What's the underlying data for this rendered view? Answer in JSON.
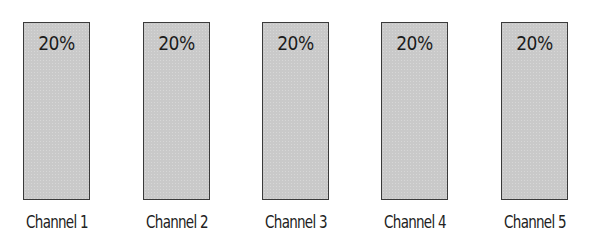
{
  "diagram": {
    "channels": [
      {
        "label": "Channel 1",
        "share": "20%"
      },
      {
        "label": "Channel 2",
        "share": "20%"
      },
      {
        "label": "Channel 3",
        "share": "20%"
      },
      {
        "label": "Channel 4",
        "share": "20%"
      },
      {
        "label": "Channel 5",
        "share": "20%"
      }
    ],
    "colors": {
      "bar_fill": "#c9c9c9",
      "bar_border": "#3a3a3a",
      "text": "#1c1c1c"
    }
  }
}
